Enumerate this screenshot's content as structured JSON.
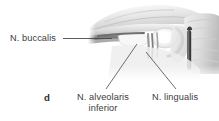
{
  "figure": {
    "letter": "d",
    "background_color": "#ffffff",
    "text_color": "#3b3b3b",
    "leader_color": "#4a4a4a",
    "width": 219,
    "height": 121
  },
  "labels": [
    {
      "id": "buccalis",
      "text": "N. buccalis",
      "lines": [
        "N. buccalis"
      ]
    },
    {
      "id": "alveolaris",
      "text": "N. alveolaris inferior",
      "lines": [
        "N. alveolaris",
        "inferior"
      ],
      "line1": "N. alveolaris",
      "line2": "inferior"
    },
    {
      "id": "lingualis",
      "text": "N. lingualis",
      "lines": [
        "N. lingualis"
      ]
    }
  ],
  "image": {
    "alt": "grayscale anatomical dissection photograph of mandibular nerve branches",
    "kind": "anatomical-photograph"
  }
}
